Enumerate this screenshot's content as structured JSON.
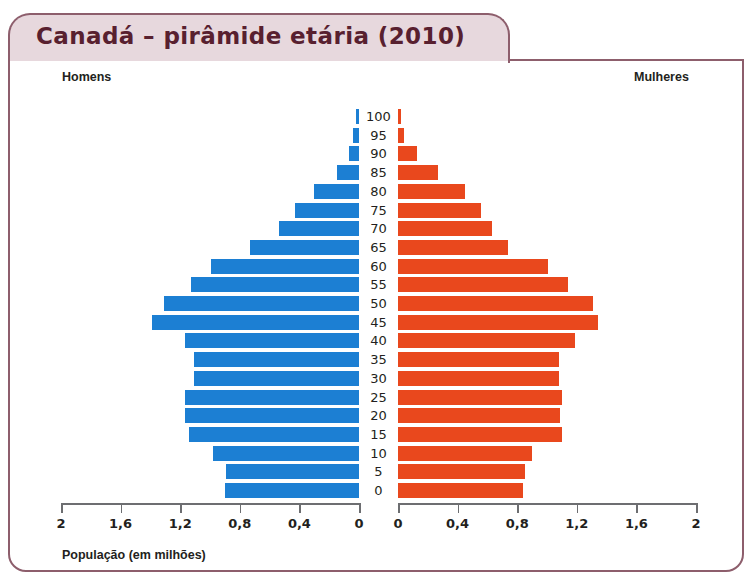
{
  "title": "Canadá – pirâmide etária (2010)",
  "legend": {
    "left_label": "Homens",
    "right_label": "Mulheres"
  },
  "axis_caption": "População (em milhões)",
  "colors": {
    "male": "#1c7fd3",
    "female": "#e9481d",
    "frame": "#8d5e6c",
    "title_bg": "#e7d8dd",
    "title_text": "#58202f",
    "axis": "#6d6e71"
  },
  "chart_data": {
    "type": "bar",
    "subtype": "population-pyramid",
    "title": "Canadá – pirâmide etária (2010)",
    "xlabel": "População (em milhões)",
    "ylabel": "",
    "grid": false,
    "legend_position": "top",
    "xlim": [
      0,
      2
    ],
    "xtick_labels_left": [
      "2",
      "1,6",
      "1,2",
      "0,8",
      "0,4",
      "0"
    ],
    "xtick_labels_right": [
      "0",
      "0,4",
      "0,8",
      "1,2",
      "1,6",
      "2"
    ],
    "xtick_values": [
      2,
      1.6,
      1.2,
      0.8,
      0.4,
      0
    ],
    "categories": [
      "100",
      "95",
      "90",
      "85",
      "80",
      "75",
      "70",
      "65",
      "60",
      "55",
      "50",
      "45",
      "40",
      "35",
      "30",
      "25",
      "20",
      "15",
      "10",
      "5",
      "0"
    ],
    "series": [
      {
        "name": "Homens",
        "color": "#1c7fd3",
        "values": [
          0.02,
          0.04,
          0.07,
          0.15,
          0.3,
          0.43,
          0.54,
          0.73,
          0.99,
          1.13,
          1.31,
          1.39,
          1.17,
          1.11,
          1.11,
          1.17,
          1.17,
          1.14,
          0.98,
          0.89,
          0.9
        ]
      },
      {
        "name": "Mulheres",
        "color": "#e9481d",
        "values": [
          0.02,
          0.04,
          0.13,
          0.27,
          0.45,
          0.56,
          0.63,
          0.74,
          1.01,
          1.14,
          1.31,
          1.34,
          1.19,
          1.08,
          1.08,
          1.1,
          1.09,
          1.1,
          0.9,
          0.85,
          0.84
        ]
      }
    ]
  }
}
